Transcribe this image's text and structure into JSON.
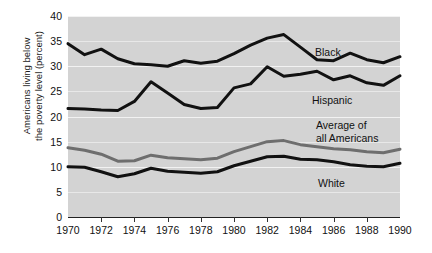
{
  "chart_data": {
    "type": "line",
    "title": "",
    "xlabel": "",
    "ylabel": "Americans living below\nthe poverty level (percent)",
    "xlim": [
      1970,
      1990
    ],
    "ylim": [
      0,
      40
    ],
    "grid": true,
    "legend_position": "inline-annotations",
    "x": [
      1970,
      1971,
      1972,
      1973,
      1974,
      1975,
      1976,
      1977,
      1978,
      1979,
      1980,
      1981,
      1982,
      1983,
      1984,
      1985,
      1986,
      1987,
      1988,
      1989,
      1990
    ],
    "y_ticks": [
      0,
      5,
      10,
      15,
      20,
      25,
      30,
      35,
      40
    ],
    "x_ticks": [
      1970,
      1972,
      1974,
      1976,
      1978,
      1980,
      1982,
      1984,
      1986,
      1988,
      1990
    ],
    "series": [
      {
        "name": "Black",
        "color": "#111111",
        "width": 3.0,
        "label": "Black",
        "values": [
          34.5,
          32.3,
          33.4,
          31.5,
          30.5,
          30.3,
          30.0,
          31.1,
          30.6,
          31.0,
          32.5,
          34.2,
          35.6,
          36.3,
          33.8,
          31.3,
          31.1,
          32.6,
          31.3,
          30.7,
          31.9
        ]
      },
      {
        "name": "Hispanic",
        "color": "#111111",
        "width": 3.0,
        "label": "Hispanic",
        "values": [
          21.6,
          21.5,
          21.3,
          21.2,
          23.0,
          26.9,
          24.7,
          22.4,
          21.6,
          21.8,
          25.7,
          26.5,
          29.9,
          28.0,
          28.4,
          29.0,
          27.3,
          28.1,
          26.7,
          26.2,
          28.1
        ]
      },
      {
        "name": "Average of all Americans",
        "color": "#6e6e6e",
        "width": 3.0,
        "label": "Average of\nall Americans",
        "values": [
          13.8,
          13.3,
          12.5,
          11.1,
          11.2,
          12.3,
          11.8,
          11.6,
          11.4,
          11.7,
          13.0,
          14.0,
          15.0,
          15.2,
          14.4,
          14.0,
          13.6,
          13.4,
          13.0,
          12.8,
          13.5
        ]
      },
      {
        "name": "White",
        "color": "#111111",
        "width": 3.0,
        "label": "White",
        "values": [
          10.0,
          9.9,
          9.0,
          8.0,
          8.6,
          9.7,
          9.1,
          8.9,
          8.7,
          9.0,
          10.2,
          11.1,
          12.0,
          12.1,
          11.5,
          11.4,
          11.0,
          10.4,
          10.1,
          10.0,
          10.7
        ]
      }
    ],
    "annotations": [
      {
        "text": "Black",
        "x_px": 315,
        "y_px": 46
      },
      {
        "text": "Hispanic",
        "x_px": 312,
        "y_px": 94
      },
      {
        "text": "Average of\nall Americans",
        "x_px": 316,
        "y_px": 119
      },
      {
        "text": "White",
        "x_px": 318,
        "y_px": 177
      }
    ]
  },
  "axis": {
    "y_title": "Americans living below\nthe poverty level (percent)",
    "y_tick_labels": [
      "40",
      "35",
      "30",
      "25",
      "20",
      "15",
      "10",
      "5",
      "0"
    ],
    "x_tick_labels": [
      "1970",
      "1972",
      "1974",
      "1976",
      "1978",
      "1980",
      "1982",
      "1984",
      "1986",
      "1988",
      "1990"
    ]
  },
  "style": {
    "plot_background": "#d3d3d3",
    "gridline_color": "#f2f2f2",
    "axis_color": "#222222",
    "text_color": "#1a1a1a",
    "average_series_color": "#6e6e6e"
  }
}
